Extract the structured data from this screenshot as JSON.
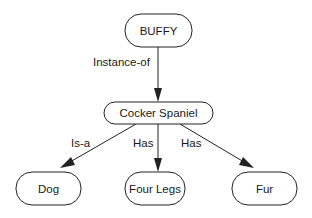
{
  "diagram": {
    "type": "semantic-network",
    "nodes": [
      {
        "id": "buffy",
        "label": "BUFFY",
        "x": 125,
        "y": 14,
        "w": 67,
        "h": 33
      },
      {
        "id": "cocker",
        "label": "Cocker Spaniel",
        "x": 104,
        "y": 102,
        "w": 109,
        "h": 22
      },
      {
        "id": "dog",
        "label": "Dog",
        "x": 16,
        "y": 172,
        "w": 65,
        "h": 33
      },
      {
        "id": "legs",
        "label": "Four Legs",
        "x": 125,
        "y": 172,
        "w": 60,
        "h": 33
      },
      {
        "id": "fur",
        "label": "Fur",
        "x": 232,
        "y": 172,
        "w": 65,
        "h": 33
      }
    ],
    "edges": [
      {
        "from": "buffy",
        "to": "cocker",
        "label": "Instance-of"
      },
      {
        "from": "cocker",
        "to": "dog",
        "label": "Is-a"
      },
      {
        "from": "cocker",
        "to": "legs",
        "label": "Has"
      },
      {
        "from": "cocker",
        "to": "fur",
        "label": "Has"
      }
    ]
  }
}
